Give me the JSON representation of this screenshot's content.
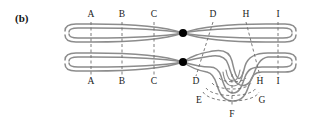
{
  "figure": {
    "panel_label": "(b)",
    "type": "schematic-cross-section-diagram",
    "background_color": "#ffffff",
    "stroke_color": "#8c8c8c",
    "dash_color": "#6e6e6e",
    "node_color": "#000000",
    "text_color": "#1a1a1a"
  },
  "markers": {
    "top_row": [
      {
        "id": "A",
        "label": "A",
        "x": 91,
        "y": 14
      },
      {
        "id": "B",
        "label": "B",
        "x": 122,
        "y": 14
      },
      {
        "id": "C",
        "label": "C",
        "x": 154,
        "y": 14
      },
      {
        "id": "D",
        "label": "D",
        "x": 213,
        "y": 14
      },
      {
        "id": "H",
        "label": "H",
        "x": 246,
        "y": 14
      },
      {
        "id": "I",
        "label": "I",
        "x": 278,
        "y": 14
      }
    ],
    "bottom_row": [
      {
        "id": "A2",
        "label": "A",
        "x": 91,
        "y": 77
      },
      {
        "id": "B2",
        "label": "B",
        "x": 122,
        "y": 77
      },
      {
        "id": "C2",
        "label": "C",
        "x": 154,
        "y": 77
      },
      {
        "id": "D2",
        "label": "D",
        "x": 197,
        "y": 77
      },
      {
        "id": "H2",
        "label": "H",
        "x": 259,
        "y": 77
      },
      {
        "id": "I2",
        "label": "I",
        "x": 278,
        "y": 77
      }
    ],
    "loop_row": [
      {
        "id": "E",
        "label": "E",
        "x": 199,
        "y": 97
      },
      {
        "id": "G",
        "label": "G",
        "x": 262,
        "y": 97
      },
      {
        "id": "F",
        "label": "F",
        "x": 231,
        "y": 111
      }
    ]
  },
  "dashed_cut_lines": [
    {
      "id": "A",
      "x1": 91,
      "y1": 22,
      "x2": 91,
      "y2": 76
    },
    {
      "id": "B",
      "x1": 122,
      "y1": 22,
      "x2": 122,
      "y2": 76
    },
    {
      "id": "C",
      "x1": 154,
      "y1": 22,
      "x2": 154,
      "y2": 76
    },
    {
      "id": "D",
      "x1": 213,
      "y1": 22,
      "x2": 196,
      "y2": 76
    },
    {
      "id": "H",
      "x1": 246,
      "y1": 22,
      "x2": 260,
      "y2": 76
    },
    {
      "id": "I",
      "x1": 278,
      "y1": 22,
      "x2": 278,
      "y2": 76
    }
  ],
  "nodes": [
    {
      "id": "node-top",
      "label": "pinch-point-upper",
      "cx": 183,
      "cy": 33,
      "r": 4
    },
    {
      "id": "node-bottom",
      "label": "pinch-point-lower",
      "cx": 183,
      "cy": 62,
      "r": 4
    }
  ],
  "strands": {
    "count_horizontal": 8,
    "left_turnarounds": 4,
    "right_turnarounds": 4,
    "loop_strands": 4
  }
}
